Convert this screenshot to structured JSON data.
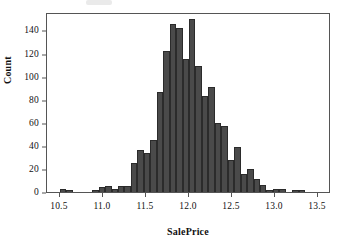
{
  "chart_data": {
    "type": "bar",
    "subtype": "histogram",
    "title": "",
    "xlabel": "SalePrice",
    "ylabel": "Count",
    "xlim": [
      10.35,
      13.65
    ],
    "ylim": [
      0,
      156
    ],
    "grid": false,
    "legend": null,
    "bar_color": "#4a4a4a",
    "bar_edge_color": "#2b2b2b",
    "bin_width": 0.075,
    "xticks": [
      10.5,
      11.0,
      11.5,
      12.0,
      12.5,
      13.0,
      13.5
    ],
    "xtick_labels": [
      "10.5",
      "11.0",
      "11.5",
      "12.0",
      "12.5",
      "13.0",
      "13.5"
    ],
    "yticks": [
      0,
      20,
      40,
      60,
      80,
      100,
      120,
      140
    ],
    "ytick_labels": [
      "0",
      "20",
      "40",
      "60",
      "80",
      "100",
      "120",
      "140"
    ],
    "bins": [
      {
        "x": 10.5,
        "count": 3
      },
      {
        "x": 10.575,
        "count": 2
      },
      {
        "x": 10.65,
        "count": 0
      },
      {
        "x": 10.725,
        "count": 0
      },
      {
        "x": 10.8,
        "count": 0
      },
      {
        "x": 10.875,
        "count": 2
      },
      {
        "x": 10.95,
        "count": 4
      },
      {
        "x": 11.025,
        "count": 5
      },
      {
        "x": 11.1,
        "count": 3
      },
      {
        "x": 11.175,
        "count": 5
      },
      {
        "x": 11.25,
        "count": 5
      },
      {
        "x": 11.325,
        "count": 25
      },
      {
        "x": 11.4,
        "count": 36
      },
      {
        "x": 11.475,
        "count": 34
      },
      {
        "x": 11.55,
        "count": 45
      },
      {
        "x": 11.625,
        "count": 87
      },
      {
        "x": 11.7,
        "count": 122
      },
      {
        "x": 11.775,
        "count": 146
      },
      {
        "x": 11.85,
        "count": 142
      },
      {
        "x": 11.925,
        "count": 115
      },
      {
        "x": 12.0,
        "count": 150
      },
      {
        "x": 12.075,
        "count": 109
      },
      {
        "x": 12.15,
        "count": 83
      },
      {
        "x": 12.225,
        "count": 91
      },
      {
        "x": 12.3,
        "count": 60
      },
      {
        "x": 12.375,
        "count": 57
      },
      {
        "x": 12.45,
        "count": 28
      },
      {
        "x": 12.525,
        "count": 39
      },
      {
        "x": 12.6,
        "count": 16
      },
      {
        "x": 12.675,
        "count": 20
      },
      {
        "x": 12.75,
        "count": 11
      },
      {
        "x": 12.825,
        "count": 6
      },
      {
        "x": 12.9,
        "count": 2
      },
      {
        "x": 12.975,
        "count": 3
      },
      {
        "x": 13.05,
        "count": 3
      },
      {
        "x": 13.125,
        "count": 0
      },
      {
        "x": 13.2,
        "count": 2
      },
      {
        "x": 13.275,
        "count": 2
      }
    ]
  },
  "figure": {
    "x_axis_title": "SalePrice",
    "y_axis_title": "Count"
  }
}
